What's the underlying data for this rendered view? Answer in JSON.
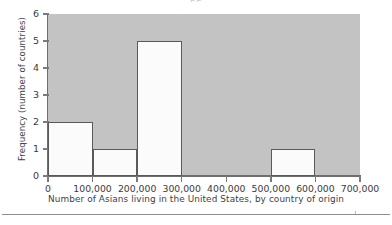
{
  "figure": {
    "title_remnant": "pp",
    "background_color": "#ffffff",
    "plot_background_color": "#c3c3c3",
    "bar_fill_color": "#fbfbfb",
    "bar_edge_color": "#5a5a5a",
    "axis_color": "#6e6e6e",
    "text_color": "#3a3a3a"
  },
  "chart_data": {
    "type": "bar",
    "title": "",
    "xlabel": "Number of Asians living in the United States, by country of origin",
    "ylabel": "Frequency (number of countries)",
    "categories": [
      "0-100,000",
      "100,000-200,000",
      "200,000-300,000",
      "300,000-400,000",
      "400,000-500,000",
      "500,000-600,000",
      "600,000-700,000"
    ],
    "values": [
      2,
      1,
      5,
      0,
      0,
      1,
      0
    ],
    "bin_edges": [
      0,
      100000,
      200000,
      300000,
      400000,
      500000,
      600000,
      700000
    ],
    "xlim": [
      0,
      700000
    ],
    "ylim": [
      0,
      6
    ],
    "x_tick_labels": [
      "0",
      "100,000",
      "200,000",
      "300,000",
      "400,000",
      "500,000",
      "600,000",
      "700,000"
    ],
    "x_tick_values": [
      0,
      100000,
      200000,
      300000,
      400000,
      500000,
      600000,
      700000
    ],
    "y_tick_labels": [
      "0",
      "1",
      "2",
      "3",
      "4",
      "5",
      "6"
    ],
    "y_tick_values": [
      0,
      1,
      2,
      3,
      4,
      5,
      6
    ],
    "grid": false,
    "legend": null,
    "legend_position": "none"
  }
}
